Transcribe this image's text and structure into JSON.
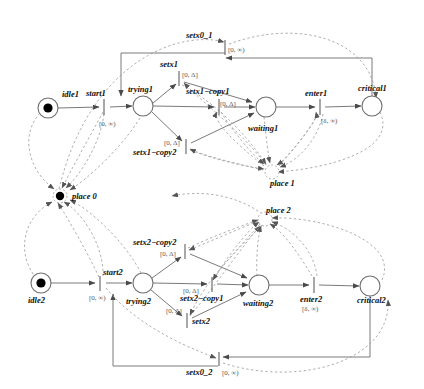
{
  "diagram": {
    "colors": {
      "solid_arc": "#7a7a7a",
      "dashed_arc": "#9a9a9a",
      "node_stroke": "#6e6e6e",
      "token": "#000000",
      "label_text": "#111111",
      "guard_text": "#555555"
    },
    "places": [
      {
        "id": "idle1",
        "label": "idle1",
        "tokens": 1,
        "cx": 48,
        "cy": 108,
        "r": 10
      },
      {
        "id": "trying1",
        "label": "trying1",
        "tokens": 0,
        "cx": 143,
        "cy": 106,
        "r": 10
      },
      {
        "id": "waiting1",
        "label": "waiting1",
        "tokens": 0,
        "cx": 266,
        "cy": 107,
        "r": 10
      },
      {
        "id": "critical1",
        "label": "critical1",
        "tokens": 0,
        "cx": 372,
        "cy": 106,
        "r": 10
      },
      {
        "id": "idle2",
        "label": "idle2",
        "tokens": 1,
        "cx": 41,
        "cy": 283,
        "r": 10
      },
      {
        "id": "trying2",
        "label": "trying2",
        "tokens": 0,
        "cx": 143,
        "cy": 283,
        "r": 10
      },
      {
        "id": "waiting2",
        "label": "waiting2",
        "tokens": 0,
        "cx": 259,
        "cy": 285,
        "r": 10
      },
      {
        "id": "critical2",
        "label": "critical2",
        "tokens": 0,
        "cx": 370,
        "cy": 286,
        "r": 10
      }
    ],
    "hubs": [
      {
        "id": "place0",
        "label": "place 0",
        "tokens": 1,
        "cx": 60,
        "cy": 196,
        "r": 7
      },
      {
        "id": "place1",
        "label": "place 1",
        "tokens": 0,
        "cx": 272,
        "cy": 172,
        "r": 7
      },
      {
        "id": "place2",
        "label": "place 2",
        "tokens": 0,
        "cx": 265,
        "cy": 219,
        "r": 7
      }
    ],
    "transitions": [
      {
        "id": "start1",
        "label": "start1",
        "guard": "[0, ∞)",
        "x": 104,
        "y": 106
      },
      {
        "id": "setx1",
        "label": "setx1",
        "guard": "[0, Δ]",
        "x": 179,
        "y": 78
      },
      {
        "id": "setx1copy1",
        "label": "setx1−copy1",
        "guard": "[0, Δ]",
        "x": 219,
        "y": 107
      },
      {
        "id": "setx1copy2",
        "label": "setx1−copy2",
        "guard": "[0, Δ]",
        "x": 186,
        "y": 146
      },
      {
        "id": "enter1",
        "label": "enter1",
        "guard": "[δ, ∞)",
        "x": 320,
        "y": 107
      },
      {
        "id": "setx0_1",
        "label": "setx0_1",
        "guard": "[0, ∞)",
        "x": 225,
        "y": 45
      },
      {
        "id": "start2",
        "label": "start2",
        "guard": "[0, ∞)",
        "x": 100,
        "y": 283
      },
      {
        "id": "setx2copy2",
        "label": "setx2−copy2",
        "guard": "[0, Δ]",
        "x": 185,
        "y": 251
      },
      {
        "id": "setx2copy1",
        "label": "setx2−copy1",
        "guard": "[0, Δ]",
        "x": 212,
        "y": 284
      },
      {
        "id": "setx2",
        "label": "setx2",
        "guard": "[0, Δ]",
        "x": 187,
        "y": 320
      },
      {
        "id": "enter2",
        "label": "enter2",
        "guard": "[δ, ∞)",
        "x": 314,
        "y": 285
      },
      {
        "id": "setx0_2",
        "label": "setx0_2",
        "guard": "[0, ∞)",
        "x": 219,
        "y": 360
      }
    ]
  }
}
